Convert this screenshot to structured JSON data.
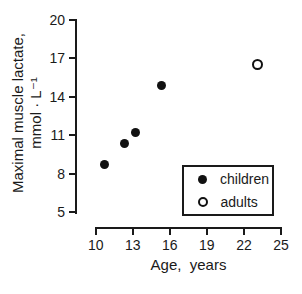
{
  "figure": {
    "background": "#ffffff",
    "ink_color": "#1a1a1a",
    "marker_color": "#111111"
  },
  "chart_data": {
    "type": "scatter",
    "title": "",
    "xlabel": "Age,  years",
    "ylabel_line1": "Maximal muscle lactate,",
    "ylabel_line2": "mmol · L⁻¹",
    "xlim": [
      10,
      25
    ],
    "ylim": [
      5,
      20
    ],
    "x_ticks": [
      10,
      13,
      16,
      19,
      22,
      25
    ],
    "y_ticks": [
      20,
      17,
      14,
      11,
      8,
      5
    ],
    "grid": false,
    "legend_position": "lower-right",
    "series": [
      {
        "name": "children",
        "marker": "filled-circle",
        "color": "#111111",
        "points": [
          [
            10.7,
            8.7
          ],
          [
            12.3,
            10.4
          ],
          [
            13.2,
            11.2
          ],
          [
            15.3,
            14.9
          ]
        ]
      },
      {
        "name": "adults",
        "marker": "open-circle",
        "color": "#111111",
        "points": [
          [
            23.1,
            16.5
          ]
        ]
      }
    ]
  },
  "legend": {
    "items": [
      {
        "label": "children",
        "marker": "filled-circle"
      },
      {
        "label": "adults",
        "marker": "open-circle"
      }
    ]
  }
}
